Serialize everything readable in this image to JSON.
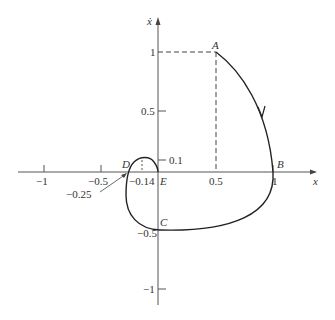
{
  "axes": {
    "x_label": "x",
    "y_label": "ẋ",
    "x_ticks": [
      {
        "value": -1,
        "label": "−1"
      },
      {
        "value": -0.5,
        "label": "−0.5"
      },
      {
        "value": 0.5,
        "label": "0.5"
      },
      {
        "value": 1,
        "label": "1"
      }
    ],
    "y_ticks": [
      {
        "value": 1,
        "label": "1"
      },
      {
        "value": 0.5,
        "label": "0.5"
      },
      {
        "value": 0.1,
        "label": "0.1"
      },
      {
        "value": -0.5,
        "label": "−0.5"
      },
      {
        "value": -1,
        "label": "−1"
      }
    ]
  },
  "points": {
    "A": {
      "label": "A",
      "x": 0.5,
      "y": 1
    },
    "B": {
      "label": "B",
      "x": 1,
      "y": 0
    },
    "C": {
      "label": "C",
      "x": 0,
      "y": -0.5
    },
    "D": {
      "label": "D",
      "x": -0.25,
      "y": 0
    },
    "E": {
      "label": "E",
      "x": 0,
      "y": 0
    }
  },
  "annotations": {
    "peak_x_label": "−0.14",
    "peak_y_label": "0.1",
    "d_value_label": "−0.25"
  }
}
